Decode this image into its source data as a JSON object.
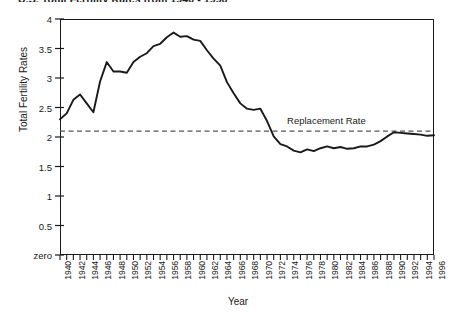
{
  "chart_data": {
    "type": "line",
    "title": "U.S. Total Fertility Rates from 1940 - 1996",
    "xlabel": "Year",
    "ylabel": "Total Fertility Rates",
    "xlim": [
      1940,
      1996
    ],
    "ylim": [
      0,
      4
    ],
    "grid": false,
    "legend": false,
    "y_ticks": [
      "4",
      "3.5",
      "3",
      "2.5",
      "2",
      "1.5",
      "1",
      "0.5",
      "zero"
    ],
    "y_tick_values": [
      4,
      3.5,
      3,
      2.5,
      2,
      1.5,
      1,
      0.5,
      0
    ],
    "x_tick_labels": [
      "1940",
      "1942",
      "1944",
      "1946",
      "1948",
      "1950",
      "1952",
      "1954",
      "1956",
      "1958",
      "1960",
      "1962",
      "1964",
      "1966",
      "1968",
      "1970",
      "1972",
      "1974",
      "1976",
      "1978",
      "1980",
      "1982",
      "1984",
      "1986",
      "1988",
      "1990",
      "1992",
      "1994",
      "1996"
    ],
    "annotations": [
      {
        "text": "Replacement Rate",
        "value": 2.1,
        "style": "dashed-horizontal-line"
      }
    ],
    "reference_line": {
      "label": "Replacement Rate",
      "value": 2.1
    },
    "series": [
      {
        "name": "Total Fertility Rate",
        "color": "#1a1a1a",
        "x": [
          1940,
          1941,
          1942,
          1943,
          1944,
          1945,
          1946,
          1947,
          1948,
          1949,
          1950,
          1951,
          1952,
          1953,
          1954,
          1955,
          1956,
          1957,
          1958,
          1959,
          1960,
          1961,
          1962,
          1963,
          1964,
          1965,
          1966,
          1967,
          1968,
          1969,
          1970,
          1971,
          1972,
          1973,
          1974,
          1975,
          1976,
          1977,
          1978,
          1979,
          1980,
          1981,
          1982,
          1983,
          1984,
          1985,
          1986,
          1987,
          1988,
          1989,
          1990,
          1991,
          1992,
          1993,
          1994,
          1995,
          1996
        ],
        "values": [
          2.3,
          2.4,
          2.63,
          2.72,
          2.57,
          2.42,
          2.94,
          3.27,
          3.11,
          3.11,
          3.09,
          3.27,
          3.36,
          3.42,
          3.54,
          3.58,
          3.69,
          3.77,
          3.7,
          3.71,
          3.65,
          3.63,
          3.47,
          3.33,
          3.21,
          2.93,
          2.74,
          2.57,
          2.48,
          2.46,
          2.48,
          2.27,
          2.01,
          1.88,
          1.84,
          1.77,
          1.74,
          1.79,
          1.76,
          1.81,
          1.84,
          1.81,
          1.83,
          1.8,
          1.81,
          1.84,
          1.84,
          1.87,
          1.93,
          2.01,
          2.08,
          2.07,
          2.06,
          2.05,
          2.04,
          2.02,
          2.03
        ]
      }
    ]
  },
  "axes": {
    "y_title": "Total Fertility Rates",
    "x_title": "Year"
  }
}
